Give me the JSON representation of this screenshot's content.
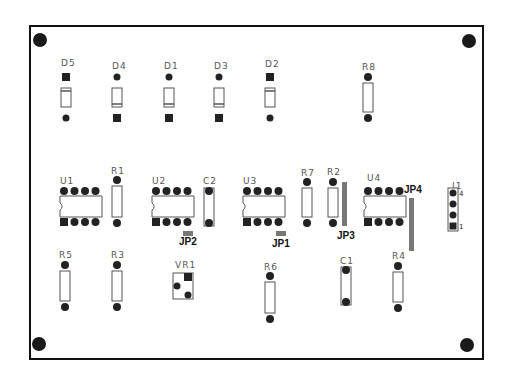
{
  "board": {
    "title": "PCB component layout",
    "colors": {
      "outline": "#111111",
      "pad": "#222222",
      "body": "#ffffff",
      "body_stroke": "#555555",
      "jumper": "#777777",
      "label": "#555555",
      "jumper_label": "#111111"
    },
    "mounting_holes": [
      {
        "id": "MH1",
        "x": 40,
        "y": 40
      },
      {
        "id": "MH2",
        "x": 469,
        "y": 41
      },
      {
        "id": "MH3",
        "x": 39,
        "y": 344
      },
      {
        "id": "MH4",
        "x": 467,
        "y": 345
      }
    ]
  },
  "diodes": [
    {
      "ref": "D5",
      "x": 66,
      "label_y": 66,
      "square_top": true
    },
    {
      "ref": "D4",
      "x": 117,
      "label_y": 69,
      "square_top": false
    },
    {
      "ref": "D1",
      "x": 169,
      "label_y": 69,
      "square_top": false
    },
    {
      "ref": "D3",
      "x": 219,
      "label_y": 69,
      "square_top": false
    },
    {
      "ref": "D2",
      "x": 270,
      "label_y": 67,
      "square_top": true
    }
  ],
  "resistors_vertical": [
    {
      "ref": "R8",
      "x": 368,
      "top": 77,
      "bottom": 118,
      "label_y": 70
    },
    {
      "ref": "R1",
      "x": 117,
      "top": 180,
      "bottom": 223,
      "label_y": 174
    },
    {
      "ref": "R7",
      "x": 307,
      "top": 182,
      "bottom": 223,
      "label_y": 176
    },
    {
      "ref": "R2",
      "x": 333,
      "top": 182,
      "bottom": 223,
      "label_y": 175
    },
    {
      "ref": "R5",
      "x": 65,
      "top": 265,
      "bottom": 307,
      "label_y": 258
    },
    {
      "ref": "R3",
      "x": 117,
      "top": 265,
      "bottom": 307,
      "label_y": 258
    },
    {
      "ref": "R6",
      "x": 270,
      "top": 276,
      "bottom": 319,
      "label_y": 270
    },
    {
      "ref": "R4",
      "x": 398,
      "top": 266,
      "bottom": 308,
      "label_y": 259
    }
  ],
  "capacitors": [
    {
      "ref": "C2",
      "x": 209,
      "top": 191,
      "bottom": 223,
      "label_y": 184
    },
    {
      "ref": "C1",
      "x": 346,
      "top": 270,
      "bottom": 302,
      "label_y": 264
    }
  ],
  "ics": [
    {
      "ref": "U1",
      "x": 62,
      "y": 191,
      "label_x": 60,
      "label_y": 184
    },
    {
      "ref": "U2",
      "x": 154,
      "y": 191,
      "label_x": 152,
      "label_y": 184
    },
    {
      "ref": "U3",
      "x": 245,
      "y": 191,
      "label_x": 243,
      "label_y": 184
    },
    {
      "ref": "U4",
      "x": 366,
      "y": 191,
      "label_x": 367,
      "label_y": 181
    }
  ],
  "jumpers": [
    {
      "ref": "JP1",
      "x": 276,
      "y": 231,
      "w": 10,
      "h": 5,
      "label_x": 272,
      "label_y": 247
    },
    {
      "ref": "JP2",
      "x": 183,
      "y": 231,
      "w": 10,
      "h": 5,
      "label_x": 179,
      "label_y": 245
    },
    {
      "ref": "JP3",
      "x": 342,
      "y": 182,
      "w": 5,
      "h": 44,
      "label_x": 337,
      "label_y": 239
    },
    {
      "ref": "JP4",
      "x": 409,
      "y": 198,
      "w": 5,
      "h": 53,
      "label_x": 404,
      "label_y": 193
    }
  ],
  "connector": {
    "ref": "J1",
    "x": 453,
    "top": 193,
    "pitch": 11,
    "pins": 4,
    "pin1_label": "1",
    "pin4_label": "4",
    "label_x": 452,
    "label_y": 189
  },
  "trimpot": {
    "ref": "VR1",
    "x": 173,
    "y": 273,
    "w": 20,
    "h": 26,
    "label_x": 175,
    "label_y": 268
  }
}
